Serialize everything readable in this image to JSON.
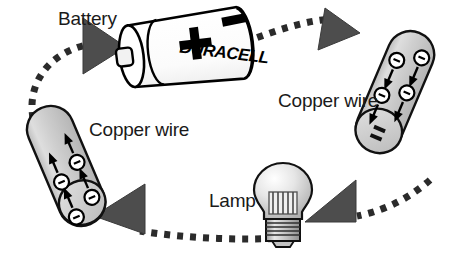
{
  "diagram": {
    "background_color": "#ffffff",
    "labels": {
      "battery": "Battery",
      "copper_wire_left": "Copper wire",
      "copper_wire_right": "Copper wire",
      "lamp": "Lamp"
    },
    "battery": {
      "brand_text": "DURACELL",
      "positive_terminal": "+",
      "negative_terminal": "–",
      "body_color": "#ffffff",
      "outline_color": "#000000"
    },
    "wires": [
      {
        "name": "copper-wire-left",
        "electron_count": 4,
        "electron_symbol": "–",
        "electron_flow_direction": "up-right",
        "fill_color": "#c9c9c9",
        "end_cap_label": "–"
      },
      {
        "name": "copper-wire-right",
        "electron_count": 4,
        "electron_symbol": "–",
        "electron_flow_direction": "down-right",
        "fill_color": "#c9c9c9",
        "end_cap_label": "–"
      }
    ],
    "lamp": {
      "bulb_color": "#d7d7d7",
      "filament": "coiled",
      "base": "screw-thread"
    },
    "current_path": {
      "style": "dashed",
      "dash_color": "#2b2b2b",
      "arrow_color": "#4a4a4a",
      "arrow_count": 4,
      "arrow_directions": [
        "right",
        "right",
        "left",
        "left"
      ]
    }
  }
}
